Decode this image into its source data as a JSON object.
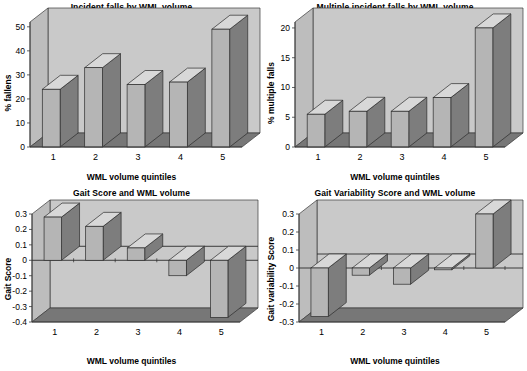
{
  "figure": {
    "background": "#ffffff",
    "panel_count": 4,
    "colors": {
      "wall": "#c9c9c9",
      "floor": "#777777",
      "bar_front": "#b5b5b5",
      "bar_side": "#7d7d7d",
      "bar_top": "#d8d8d8",
      "axis": "#3a3a3a",
      "text": "#000000"
    }
  },
  "chart_data": [
    {
      "id": "incident-falls",
      "type": "bar",
      "title": "Incident falls by WML volume",
      "xlabel": "WML volume quintiles",
      "ylabel": "% fallens",
      "categories": [
        "1",
        "2",
        "3",
        "4",
        "5"
      ],
      "values": [
        24,
        33,
        26,
        27,
        49
      ],
      "yticks": [
        0,
        10,
        20,
        30,
        40,
        50
      ],
      "ytick_labels": [
        "0",
        "10",
        "20",
        "30",
        "40",
        "50"
      ],
      "ylim": [
        0,
        52
      ],
      "grid": false,
      "legend": "none",
      "style": "3d-column"
    },
    {
      "id": "multiple-incident-falls",
      "type": "bar",
      "title": "Multiple incident falls by WML volume",
      "xlabel": "WML volume quintiles",
      "ylabel": "% multiple falls",
      "categories": [
        "1",
        "2",
        "3",
        "4",
        "5"
      ],
      "values": [
        5.5,
        6.0,
        6.0,
        8.3,
        20.0
      ],
      "yticks": [
        0,
        5,
        10,
        15,
        20
      ],
      "ytick_labels": [
        "0",
        "5",
        "10",
        "15",
        "20"
      ],
      "ylim": [
        0,
        21
      ],
      "grid": false,
      "legend": "none",
      "style": "3d-column"
    },
    {
      "id": "gait-score",
      "type": "bar",
      "title": "Gait Score and WML volume",
      "xlabel": "WML volume quintiles",
      "ylabel": "Gait Score",
      "categories": [
        "1",
        "2",
        "3",
        "4",
        "5"
      ],
      "values": [
        0.28,
        0.22,
        0.08,
        -0.1,
        -0.37
      ],
      "yticks": [
        0.3,
        0.2,
        0.1,
        0,
        -0.1,
        -0.2,
        -0.3,
        -0.4
      ],
      "ytick_labels": [
        "0.3",
        "0.2",
        "0.1",
        "0",
        "-0.1",
        "-0.2",
        "-0.3",
        "-0.4"
      ],
      "ylim": [
        -0.4,
        0.3
      ],
      "grid": false,
      "legend": "none",
      "style": "3d-column"
    },
    {
      "id": "gait-variability-score",
      "type": "bar",
      "title": "Gait Variability Score and WML volume",
      "xlabel": "WML volume quintiles",
      "ylabel": "Gait variability Score",
      "categories": [
        "1",
        "2",
        "3",
        "4",
        "5"
      ],
      "values": [
        -0.27,
        -0.04,
        -0.09,
        -0.01,
        0.3
      ],
      "yticks": [
        0.3,
        0.2,
        0.1,
        0,
        -0.1,
        -0.2,
        -0.3
      ],
      "ytick_labels": [
        "0.3",
        "0.2",
        "0.1",
        "0",
        "-0.1",
        "-0.2",
        "-0.3"
      ],
      "ylim": [
        -0.3,
        0.3
      ],
      "grid": false,
      "legend": "none",
      "style": "3d-column"
    }
  ]
}
